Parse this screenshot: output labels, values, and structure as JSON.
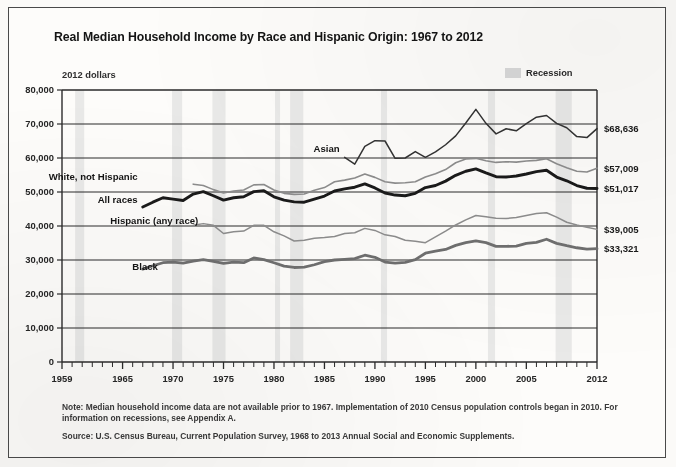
{
  "figure": {
    "title": "Real Median Household Income by Race and Hispanic Origin: 1967 to 2012",
    "units_label": "2012 dollars",
    "legend": {
      "recession_label": "Recession",
      "recession_color": "#d8d8d8"
    },
    "note": "Note: Median household income data are not available prior to 1967. Implementation of 2010 Census population controls began in 2010. For information on recessions, see Appendix A.",
    "source": "Source: U.S. Census Bureau, Current Population Survey, 1968 to 2013 Annual Social and Economic Supplements."
  },
  "chart_data": {
    "type": "line",
    "title": "Real Median Household Income by Race and Hispanic Origin: 1967 to 2012",
    "xlabel": "",
    "ylabel": "2012 dollars",
    "xlim": [
      1959,
      2012
    ],
    "ylim": [
      0,
      80000
    ],
    "grid": true,
    "legend_position": "inline-labels",
    "ytick_labels": [
      "0",
      "10,000",
      "20,000",
      "30,000",
      "40,000",
      "50,000",
      "60,000",
      "70,000",
      "80,000"
    ],
    "ytick_values": [
      0,
      10000,
      20000,
      30000,
      40000,
      50000,
      60000,
      70000,
      80000
    ],
    "xtick_labels": [
      "1959",
      "1965",
      "1970",
      "1975",
      "1980",
      "1985",
      "1990",
      "1995",
      "2000",
      "2005",
      "2012"
    ],
    "xtick_values": [
      1959,
      1965,
      1970,
      1975,
      1980,
      1985,
      1990,
      1995,
      2000,
      2005,
      2012
    ],
    "xtick_minor_step": 1,
    "recession_bands": [
      {
        "start": 1960.3,
        "end": 1961.2
      },
      {
        "start": 1969.9,
        "end": 1970.9
      },
      {
        "start": 1973.9,
        "end": 1975.2
      },
      {
        "start": 1980.1,
        "end": 1980.6
      },
      {
        "start": 1981.6,
        "end": 1982.9
      },
      {
        "start": 1990.6,
        "end": 1991.2
      },
      {
        "start": 2001.2,
        "end": 2001.9
      },
      {
        "start": 2007.9,
        "end": 2009.5
      }
    ],
    "series": [
      {
        "name": "Asian",
        "color": "#333333",
        "width": 1.5,
        "end_label": "$68,636",
        "end_value": 68636,
        "label_x": 1986.5,
        "label_y": 61800,
        "label_anchor": "end",
        "x": [
          1987,
          1988,
          1989,
          1990,
          1991,
          1992,
          1993,
          1994,
          1995,
          1996,
          1997,
          1998,
          1999,
          2000,
          2001,
          2002,
          2003,
          2004,
          2005,
          2006,
          2007,
          2008,
          2009,
          2010,
          2011,
          2012
        ],
        "values": [
          60200,
          58200,
          63400,
          65100,
          65000,
          59900,
          60000,
          61900,
          60200,
          61800,
          63900,
          66500,
          70300,
          74300,
          70200,
          67100,
          68600,
          68000,
          70100,
          72000,
          72500,
          70200,
          68900,
          66300,
          66000,
          68636
        ]
      },
      {
        "name": "White, not Hispanic",
        "color": "#8d8d8d",
        "width": 1.6,
        "end_label": "$57,009",
        "end_value": 57009,
        "label_x": 1966.5,
        "label_y": 53600,
        "label_anchor": "end",
        "x": [
          1972,
          1973,
          1974,
          1975,
          1976,
          1977,
          1978,
          1979,
          1980,
          1981,
          1982,
          1983,
          1984,
          1985,
          1986,
          1987,
          1988,
          1989,
          1990,
          1991,
          1992,
          1993,
          1994,
          1995,
          1996,
          1997,
          1998,
          1999,
          2000,
          2001,
          2002,
          2003,
          2004,
          2005,
          2006,
          2007,
          2008,
          2009,
          2010,
          2011,
          2012
        ],
        "values": [
          52300,
          51900,
          50700,
          49700,
          50300,
          50600,
          52100,
          52200,
          50600,
          49600,
          49300,
          49400,
          50500,
          51300,
          53000,
          53500,
          54100,
          55300,
          54300,
          53000,
          52600,
          52700,
          53000,
          54400,
          55400,
          56600,
          58600,
          59700,
          59900,
          59200,
          58700,
          58900,
          58800,
          59100,
          59300,
          59800,
          58300,
          57100,
          56100,
          55900,
          57009
        ]
      },
      {
        "name": "All races",
        "color": "#1a1a1a",
        "width": 2.9,
        "end_label": "$51,017",
        "end_value": 51017,
        "label_x": 1966.5,
        "label_y": 46900,
        "label_anchor": "end",
        "x": [
          1967,
          1968,
          1969,
          1970,
          1971,
          1972,
          1973,
          1974,
          1975,
          1976,
          1977,
          1978,
          1979,
          1980,
          1981,
          1982,
          1983,
          1984,
          1985,
          1986,
          1987,
          1988,
          1989,
          1990,
          1991,
          1992,
          1993,
          1994,
          1995,
          1996,
          1997,
          1998,
          1999,
          2000,
          2001,
          2002,
          2003,
          2004,
          2005,
          2006,
          2007,
          2008,
          2009,
          2010,
          2011,
          2012
        ],
        "values": [
          45600,
          47000,
          48300,
          47900,
          47500,
          49400,
          50100,
          48900,
          47600,
          48300,
          48600,
          50100,
          50400,
          48600,
          47600,
          47100,
          47000,
          47900,
          48800,
          50300,
          50900,
          51400,
          52400,
          51200,
          49700,
          49100,
          48900,
          49600,
          51300,
          51900,
          53200,
          54900,
          56100,
          56800,
          55600,
          54500,
          54400,
          54700,
          55300,
          56000,
          56400,
          54400,
          53300,
          51900,
          51100,
          51017
        ]
      },
      {
        "name": "Hispanic (any race)",
        "color": "#8d8d8d",
        "width": 1.5,
        "end_label": "$39,005",
        "end_value": 39005,
        "label_x": 1972.5,
        "label_y": 40500,
        "label_anchor": "end",
        "x": [
          1972,
          1973,
          1974,
          1975,
          1976,
          1977,
          1978,
          1979,
          1980,
          1981,
          1982,
          1983,
          1984,
          1985,
          1986,
          1987,
          1988,
          1989,
          1990,
          1991,
          1992,
          1993,
          1994,
          1995,
          1996,
          1997,
          1998,
          1999,
          2000,
          2001,
          2002,
          2003,
          2004,
          2005,
          2006,
          2007,
          2008,
          2009,
          2010,
          2011,
          2012
        ],
        "values": [
          40200,
          40700,
          40200,
          37800,
          38300,
          38500,
          40200,
          40200,
          38300,
          37100,
          35600,
          35800,
          36400,
          36600,
          36900,
          37800,
          38000,
          39300,
          38700,
          37400,
          36900,
          35800,
          35500,
          35100,
          36800,
          38500,
          40300,
          41800,
          43100,
          42700,
          42300,
          42200,
          42500,
          43100,
          43700,
          43900,
          42600,
          41100,
          40300,
          39600,
          39005
        ]
      },
      {
        "name": "Black",
        "color": "#6f6f6f",
        "width": 2.8,
        "end_label": "$33,321",
        "end_value": 33321,
        "label_x": 1968.5,
        "label_y": 27200,
        "label_anchor": "end",
        "x": [
          1967,
          1968,
          1969,
          1970,
          1971,
          1972,
          1973,
          1974,
          1975,
          1976,
          1977,
          1978,
          1979,
          1980,
          1981,
          1982,
          1983,
          1984,
          1985,
          1986,
          1987,
          1988,
          1989,
          1990,
          1991,
          1992,
          1993,
          1994,
          1995,
          1996,
          1997,
          1998,
          1999,
          2000,
          2001,
          2002,
          2003,
          2004,
          2005,
          2006,
          2007,
          2008,
          2009,
          2010,
          2011,
          2012
        ],
        "values": [
          27300,
          28300,
          29200,
          29400,
          29100,
          29700,
          30100,
          29600,
          29000,
          29400,
          29200,
          30600,
          30100,
          29200,
          28200,
          27800,
          27900,
          28600,
          29500,
          30000,
          30200,
          30400,
          31400,
          30800,
          29400,
          29100,
          29300,
          30100,
          32000,
          32600,
          33100,
          34300,
          35100,
          35600,
          35100,
          34000,
          34000,
          34100,
          34900,
          35200,
          36100,
          34900,
          34200,
          33600,
          33200,
          33321
        ]
      }
    ]
  }
}
